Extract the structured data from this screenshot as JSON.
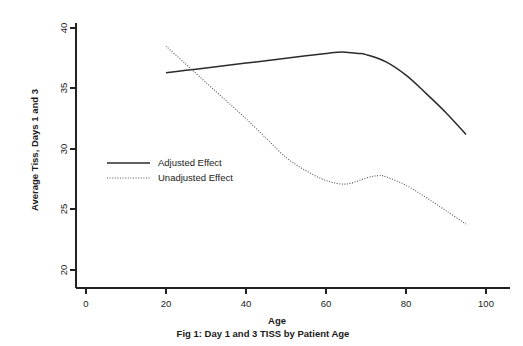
{
  "chart_data": {
    "type": "line",
    "title": "",
    "caption": "Fig 1: Day 1 and 3 TISS by Patient Age",
    "xlabel": "Age",
    "ylabel": "Average Tiss, Days 1 and 3",
    "xlim": [
      0,
      105
    ],
    "ylim": [
      19.5,
      40.5
    ],
    "xticks": [
      0,
      20,
      40,
      60,
      80,
      100
    ],
    "xticklabels": [
      "0",
      "20",
      "40",
      "60",
      "80",
      "100"
    ],
    "yticks": [
      20,
      25,
      30,
      35,
      40
    ],
    "yticklabels": [
      "20",
      "25",
      "30",
      "35",
      "40"
    ],
    "grid": false,
    "legend_position": "center-left",
    "series": [
      {
        "name": "Adjusted Effect",
        "style": "solid",
        "color": "#2b2b2b",
        "x": [
          20,
          25,
          30,
          35,
          40,
          45,
          50,
          55,
          60,
          63,
          65,
          68,
          70,
          75,
          80,
          85,
          90,
          95
        ],
        "y": [
          36.3,
          36.5,
          36.7,
          36.9,
          37.1,
          37.3,
          37.5,
          37.7,
          37.9,
          38.0,
          38.0,
          37.9,
          37.8,
          37.2,
          36.1,
          34.6,
          33.0,
          31.2
        ]
      },
      {
        "name": "Unadjusted Effect",
        "style": "dotted",
        "color": "#555555",
        "x": [
          20,
          25,
          30,
          35,
          40,
          45,
          50,
          55,
          60,
          65,
          70,
          73,
          75,
          80,
          85,
          90,
          95
        ],
        "y": [
          38.5,
          37.0,
          35.5,
          34.0,
          32.5,
          30.9,
          29.3,
          28.2,
          27.4,
          27.1,
          27.6,
          27.8,
          27.7,
          27.0,
          26.0,
          24.9,
          23.8
        ]
      }
    ]
  },
  "legend": {
    "items": [
      {
        "label": "Adjusted Effect",
        "style": "solid"
      },
      {
        "label": "Unadjusted Effect",
        "style": "dotted"
      }
    ]
  },
  "axes": {
    "x_title": "Age",
    "y_title": "Average Tiss, Days 1 and 3"
  },
  "caption": {
    "text": "Fig 1: Day 1 and 3 TISS by Patient Age"
  }
}
